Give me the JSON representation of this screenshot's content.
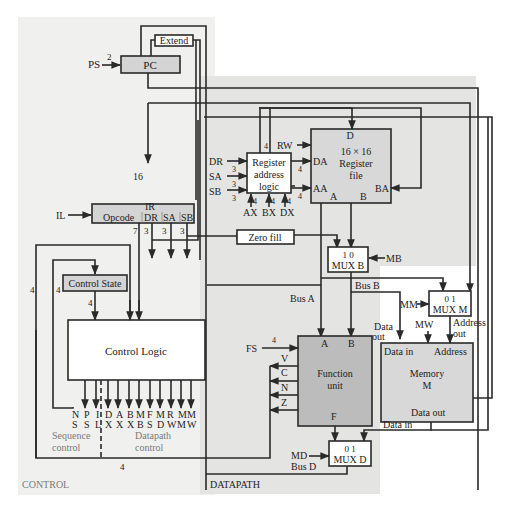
{
  "diagram": {
    "regions": {
      "control": {
        "label": "CONTROL",
        "fill": "#f0f0ef"
      },
      "datapath": {
        "label": "DATAPATH",
        "fill": "#e4e4e3"
      }
    },
    "blocks": {
      "extend": {
        "label": "Extend"
      },
      "pc": {
        "label": "PC"
      },
      "ir": {
        "label": "IR",
        "fields": [
          "Opcode",
          "DR",
          "SA",
          "SB"
        ]
      },
      "control_state": {
        "label": "Control State"
      },
      "control_logic": {
        "label": "Control Logic"
      },
      "register_address_logic": {
        "label_lines": [
          "Register",
          "address",
          "logic"
        ]
      },
      "register_file": {
        "label_lines": [
          "16 × 16",
          "Register",
          "file"
        ],
        "ports": {
          "d": "D",
          "da": "DA",
          "aa": "AA",
          "ba": "BA",
          "a": "A",
          "b": "B"
        }
      },
      "zero_fill": {
        "label": "Zero fill"
      },
      "mux_b": {
        "inputs": "1  0",
        "label": "MUX B"
      },
      "mux_m": {
        "inputs": "0  1",
        "label": "MUX M"
      },
      "mux_d": {
        "inputs": "0    1",
        "label": "MUX D"
      },
      "function_unit": {
        "label_lines": [
          "Function",
          "unit"
        ],
        "ports": {
          "a": "A",
          "b": "B",
          "f": "F"
        }
      },
      "memory": {
        "label_lines": [
          "Memory",
          "M"
        ],
        "ports": {
          "data_in": "Data in",
          "address": "Address",
          "data_out": "Data out"
        }
      }
    },
    "signals": {
      "ps": "PS",
      "ps_width": "2",
      "il": "IL",
      "ir_width": "16",
      "rw": "RW",
      "dr": "DR",
      "sa": "SA",
      "sb": "SB",
      "reg_width": "3",
      "da_width": "4",
      "aa_width": "4",
      "d_width": "4",
      "ax": "AX",
      "bx": "BX",
      "dx": "DX",
      "x_width": "4",
      "mb": "MB",
      "mm": "MM",
      "mw": "MW",
      "md": "MD",
      "fs": "FS",
      "fs_width": "4",
      "opcode_width": "7",
      "dr_width": "3",
      "sa_width": "3",
      "sb_width": "3",
      "cs_width_in": "4",
      "cs_width_out": "4",
      "loop_width": "4",
      "status_width": "4",
      "bus_a": "Bus A",
      "bus_b": "Bus B",
      "bus_d": "Bus D",
      "data_out": "Data",
      "data_out2": "out",
      "address_out": "Address",
      "address_out2": "out",
      "mem_data_in": "Data in",
      "flags": [
        "V",
        "C",
        "N",
        "Z"
      ]
    },
    "control_outputs": {
      "top": [
        "N",
        "P",
        "I",
        "D",
        "A",
        "B",
        "M",
        "F",
        "M",
        "R",
        "M",
        "M"
      ],
      "bottom": [
        "S",
        "S",
        "L",
        "X",
        "X",
        "X",
        "B",
        "S",
        "D",
        "W",
        "M",
        "W"
      ],
      "sequence_label": [
        "Sequence",
        "control"
      ],
      "datapath_label": [
        "Datapath",
        "control"
      ]
    }
  }
}
